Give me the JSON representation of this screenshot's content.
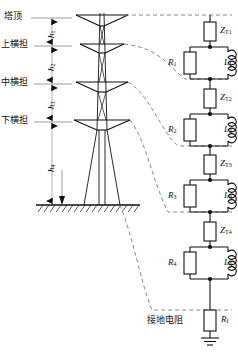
{
  "diagram": {
    "colors": {
      "line": "#1a1a1a",
      "dash": "#6e6e6e",
      "tick": "#8a8a8a",
      "ground": "#111111"
    }
  },
  "tower": {
    "levels": [
      {
        "id": "tower-top",
        "label": "塔顶",
        "y": 18
      },
      {
        "id": "upper-crossarm",
        "label": "上横担",
        "y": 46
      },
      {
        "id": "middle-crossarm",
        "label": "中横担",
        "y": 84
      },
      {
        "id": "lower-crossarm",
        "label": "下横担",
        "y": 122
      }
    ],
    "dimensions": [
      {
        "id": "h1",
        "label": "h",
        "sub": "1",
        "from": 18,
        "to": 46
      },
      {
        "id": "h2",
        "label": "h",
        "sub": "2",
        "from": 46,
        "to": 84
      },
      {
        "id": "h3",
        "label": "h",
        "sub": "3",
        "from": 84,
        "to": 122
      },
      {
        "id": "h4",
        "label": "h",
        "sub": "4",
        "from": 122,
        "to": 205
      }
    ],
    "ground_label": "ground-hatch-line",
    "ground_y": 205
  },
  "circuit": {
    "sections": [
      {
        "id": "section-1",
        "surge_impedance": {
          "label": "Z",
          "sub": "T1"
        },
        "resistor": {
          "label": "R",
          "sub": "1"
        },
        "inductor": {
          "label": "L",
          "sub": "1"
        }
      },
      {
        "id": "section-2",
        "surge_impedance": {
          "label": "Z",
          "sub": "T2"
        },
        "resistor": {
          "label": "R",
          "sub": "2"
        },
        "inductor": {
          "label": "L",
          "sub": "2"
        }
      },
      {
        "id": "section-3",
        "surge_impedance": {
          "label": "Z",
          "sub": "T3"
        },
        "resistor": {
          "label": "R",
          "sub": "3"
        },
        "inductor": {
          "label": "L",
          "sub": "3"
        }
      },
      {
        "id": "section-4",
        "surge_impedance": {
          "label": "Z",
          "sub": "T4"
        },
        "resistor": {
          "label": "R",
          "sub": "4"
        },
        "inductor": {
          "label": "L",
          "sub": "4"
        }
      }
    ],
    "footing": {
      "cn_label": "接地电阻",
      "symbol": {
        "label": "R",
        "sub": "f"
      }
    }
  }
}
